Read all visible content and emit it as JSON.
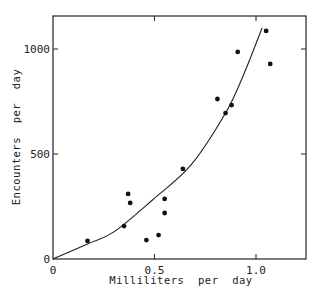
{
  "chart_data": {
    "type": "scatter",
    "title": "",
    "xlabel": "Milliliters  per  day",
    "ylabel": "Encounters  per  day",
    "xlim": [
      0,
      1.25
    ],
    "ylim": [
      0,
      1200
    ],
    "xticks": [
      {
        "value": 0,
        "label": "0"
      },
      {
        "value": 0.5,
        "label": "0.5"
      },
      {
        "value": 1.0,
        "label": "1.0"
      }
    ],
    "yticks": [
      {
        "value": 0,
        "label": "0"
      },
      {
        "value": 500,
        "label": "500"
      },
      {
        "value": 1000,
        "label": "1000"
      }
    ],
    "grid": false,
    "series": [
      {
        "name": "observations",
        "kind": "scatter",
        "points": [
          [
            0.17,
            86
          ],
          [
            0.35,
            157
          ],
          [
            0.37,
            310
          ],
          [
            0.38,
            267
          ],
          [
            0.46,
            90
          ],
          [
            0.52,
            114
          ],
          [
            0.55,
            286
          ],
          [
            0.55,
            219
          ],
          [
            0.64,
            429
          ],
          [
            0.81,
            762
          ],
          [
            0.85,
            695
          ],
          [
            0.88,
            733
          ],
          [
            0.91,
            986
          ],
          [
            1.05,
            1086
          ],
          [
            1.07,
            929
          ]
        ]
      },
      {
        "name": "fitted curve",
        "kind": "line",
        "points": [
          [
            0,
            0
          ],
          [
            0.17,
            71
          ],
          [
            0.3,
            129
          ],
          [
            0.49,
            281
          ],
          [
            0.68,
            448
          ],
          [
            0.85,
            695
          ],
          [
            0.94,
            880
          ],
          [
            1.03,
            1100
          ]
        ]
      }
    ]
  }
}
